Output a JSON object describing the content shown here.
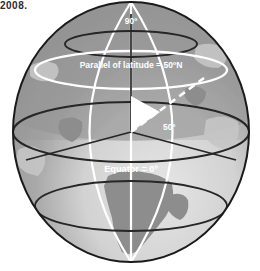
{
  "figure": {
    "clipped_caption": "2008.",
    "labels": {
      "pole": "90º",
      "parallel": "Parallel of latitude = 50ºN",
      "equator": "Equator = 0º",
      "angle": "50º"
    },
    "icons": {
      "globe": "globe-icon"
    },
    "colors": {
      "background": "#ffffff",
      "ocean_light": "#e3e3e3",
      "ocean_mid": "#9b9b9b",
      "ocean_dark": "#8e8e8e",
      "land_light": "#c9c9c9",
      "land_dark": "#8a8a8a",
      "graticule_white": "#ffffff",
      "graticule_dark": "#262626",
      "outline": "#1a1a1a",
      "wedge": "#ffffff",
      "label_text": "#ffffff",
      "caption_text": "#2b2b2b"
    },
    "geometry": {
      "center_x": 131,
      "center_y": 132,
      "radius_x": 118,
      "radius_y": 130,
      "equator_ry": 30,
      "parallel_50n_y": 70,
      "parallel_50n_ry": 18,
      "pole_y": 14,
      "angle_degrees": 50
    }
  }
}
